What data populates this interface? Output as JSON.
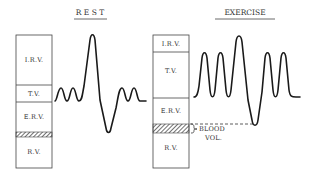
{
  "panels": {
    "rest": {
      "title": "R E S T",
      "box": {
        "segments": [
          {
            "key": "irv",
            "label": "I.R.V.",
            "top": 35,
            "bottom": 85
          },
          {
            "key": "tv",
            "label": "T.V.",
            "top": 85,
            "bottom": 102
          },
          {
            "key": "erv",
            "label": "E.R.V.",
            "top": 102,
            "bottom": 132
          },
          {
            "key": "blood",
            "label": "",
            "top": 132,
            "bottom": 137,
            "hatched": true
          },
          {
            "key": "rv",
            "label": "R.V.",
            "top": 137,
            "bottom": 168
          }
        ]
      }
    },
    "exercise": {
      "title": "EXERCISE",
      "box": {
        "segments": [
          {
            "key": "irv",
            "label": "I.R.V.",
            "top": 35,
            "bottom": 52
          },
          {
            "key": "tv",
            "label": "T.V.",
            "top": 52,
            "bottom": 98
          },
          {
            "key": "erv",
            "label": "E.R.V.",
            "top": 98,
            "bottom": 124
          },
          {
            "key": "blood",
            "label": "",
            "top": 124,
            "bottom": 133,
            "hatched": true
          },
          {
            "key": "rv",
            "label": "R.V.",
            "top": 133,
            "bottom": 168
          }
        ]
      },
      "annotation": {
        "line1": "BLOOD",
        "line2": "VOL."
      }
    }
  },
  "labels": {
    "rest_title": "R E S T",
    "exercise_title": "EXERCISE",
    "rest_irv": "I.R.V.",
    "rest_tv": "T.V.",
    "rest_erv": "E.R.V.",
    "rest_rv": "R.V.",
    "ex_irv": "I.R.V.",
    "ex_tv": "T.V.",
    "ex_erv": "E.R.V.",
    "ex_rv": "R.V.",
    "blood_vol_line1": "BLOOD",
    "blood_vol_line2": "VOL."
  },
  "colors": {
    "stroke": "#1a1a1a",
    "box_stroke": "#444444",
    "text": "#333333",
    "background": "#ffffff"
  }
}
